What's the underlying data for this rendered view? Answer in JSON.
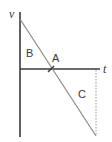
{
  "diagram": {
    "axes": {
      "y_label": "v",
      "x_label": "t"
    },
    "regions": [
      {
        "label": "B",
        "description": "triangular area above t-axis between v-axis and line"
      },
      {
        "label": "A",
        "description": "point where line crosses t-axis"
      },
      {
        "label": "C",
        "description": "triangular area below t-axis between line and dotted vertical"
      }
    ],
    "line": {
      "description": "straight line with negative slope from positive v-intercept crossing t-axis and continuing below",
      "start": [
        20,
        19
      ],
      "end": [
        96,
        136
      ]
    },
    "crossing_point": [
      51,
      69
    ],
    "dotted_line": {
      "x": 96,
      "from_y": 69,
      "to_y": 136
    },
    "colors": {
      "axis": "#3a3a3a",
      "line": "#8a8a8a",
      "dotted": "#a8a8a8",
      "text": "#3a3a3a"
    }
  }
}
